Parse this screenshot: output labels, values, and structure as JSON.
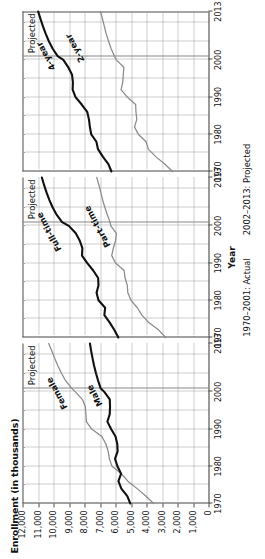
{
  "chart_data": {
    "type": "line",
    "title": "",
    "xlabel": "Year",
    "ylabel": "Enrollment (in thousands)",
    "ylim": [
      0,
      12000
    ],
    "xlim": [
      1970,
      2013
    ],
    "grid": true,
    "legend_position": "inline-labels",
    "y_ticks": [
      "0",
      "1,000",
      "2,000",
      "3,000",
      "4,000",
      "5,000",
      "6,000",
      "7,000",
      "8,000",
      "9,000",
      "10,000",
      "11,000",
      "12,000"
    ],
    "y_tick_values": [
      0,
      1000,
      2000,
      3000,
      4000,
      5000,
      6000,
      7000,
      8000,
      9000,
      10000,
      11000,
      12000
    ],
    "x_ticks": [
      "1970",
      "1980",
      "1990",
      "2000",
      "2013"
    ],
    "x_tick_values": [
      1970,
      1980,
      1990,
      2000,
      2013
    ],
    "projection_divider_year": 2001,
    "projected_label": "Projected",
    "caption_actual": "1970–2001: Actual",
    "caption_projected": "2002–2013: Projected",
    "panels": [
      {
        "name": "sex",
        "annotation": "Projected",
        "series": [
          {
            "name": "Female",
            "style": "light",
            "label_anchor_year": 1996,
            "label_anchor_value": 9300,
            "x": [
              1970,
              1972,
              1974,
              1976,
              1978,
              1980,
              1982,
              1984,
              1986,
              1988,
              1990,
              1992,
              1994,
              1996,
              1998,
              2000,
              2001,
              2003,
              2005,
              2007,
              2009,
              2011,
              2013
            ],
            "values": [
              3537,
              4046,
              4601,
              5201,
              5619,
              6223,
              6394,
              6472,
              6619,
              6882,
              7535,
              7881,
              7907,
              7948,
              8138,
              8591,
              8836,
              9215,
              9490,
              9720,
              9920,
              10110,
              10310
            ]
          },
          {
            "name": "Male",
            "style": "dark",
            "label_anchor_year": 1997,
            "label_anchor_value": 7050,
            "x": [
              1970,
              1972,
              1974,
              1976,
              1978,
              1980,
              1982,
              1984,
              1986,
              1988,
              1990,
              1992,
              1994,
              1996,
              1998,
              2000,
              2001,
              2003,
              2005,
              2007,
              2009,
              2011,
              2013
            ],
            "values": [
              5044,
              5239,
              5622,
              5811,
              5641,
              5874,
              6031,
              5864,
              5885,
              5998,
              6284,
              6524,
              6372,
              6353,
              6369,
              6722,
              6961,
              7120,
              7260,
              7380,
              7480,
              7570,
              7650
            ]
          }
        ]
      },
      {
        "name": "attendance",
        "annotation": "Projected",
        "series": [
          {
            "name": "Full-time",
            "style": "dark",
            "label_anchor_year": 1994,
            "label_anchor_value": 9700,
            "x": [
              1970,
              1972,
              1974,
              1976,
              1978,
              1980,
              1982,
              1984,
              1986,
              1988,
              1990,
              1992,
              1994,
              1996,
              1998,
              2000,
              2001,
              2003,
              2005,
              2007,
              2009,
              2011,
              2013
            ],
            "values": [
              5816,
              6072,
              6370,
              6718,
              6668,
              7098,
              7221,
              7098,
              7120,
              7437,
              7821,
              8162,
              8138,
              8303,
              8563,
              9010,
              9447,
              9800,
              10060,
              10270,
              10450,
              10610,
              10750
            ]
          },
          {
            "name": "Part-time",
            "style": "light",
            "label_anchor_year": 1995,
            "label_anchor_value": 6500,
            "x": [
              1970,
              1972,
              1974,
              1976,
              1978,
              1980,
              1982,
              1984,
              1986,
              1988,
              1990,
              1992,
              1994,
              1996,
              1998,
              2000,
              2001,
              2003,
              2005,
              2007,
              2009,
              2011,
              2013
            ],
            "values": [
              2765,
              3213,
              3853,
              4294,
              4592,
              4999,
              5204,
              5238,
              5384,
              5443,
              5998,
              6243,
              6141,
              5998,
              5944,
              6303,
              6350,
              6530,
              6690,
              6830,
              6950,
              7070,
              7210
            ]
          }
        ]
      },
      {
        "name": "institution",
        "annotation": "Projected",
        "series": [
          {
            "name": "4-year",
            "style": "dark",
            "label_anchor_year": 1998,
            "label_anchor_value": 10050,
            "x": [
              1970,
              1972,
              1974,
              1976,
              1978,
              1980,
              1982,
              1984,
              1986,
              1988,
              1990,
              1992,
              1994,
              1996,
              1998,
              2000,
              2001,
              2003,
              2005,
              2007,
              2009,
              2011,
              2013
            ],
            "values": [
              6262,
              6459,
              6820,
              7129,
              7232,
              7565,
              7654,
              7711,
              7824,
              8180,
              8579,
              8765,
              8749,
              8803,
              9046,
              9364,
              9732,
              10050,
              10300,
              10500,
              10680,
              10840,
              10990
            ]
          },
          {
            "name": "2-year",
            "style": "light",
            "label_anchor_year": 2000,
            "label_anchor_value": 8200,
            "x": [
              1970,
              1972,
              1974,
              1976,
              1978,
              1980,
              1982,
              1984,
              1986,
              1988,
              1990,
              1992,
              1994,
              1996,
              1998,
              2000,
              2001,
              2003,
              2005,
              2007,
              2009,
              2011,
              2013
            ],
            "values": [
              2319,
              2826,
              3404,
              3883,
              4028,
              4532,
              4771,
              4625,
              4680,
              4700,
              5240,
              5641,
              5530,
              5498,
              5461,
              5949,
              6065,
              6280,
              6450,
              6600,
              6720,
              6840,
              6970
            ]
          }
        ]
      }
    ]
  }
}
